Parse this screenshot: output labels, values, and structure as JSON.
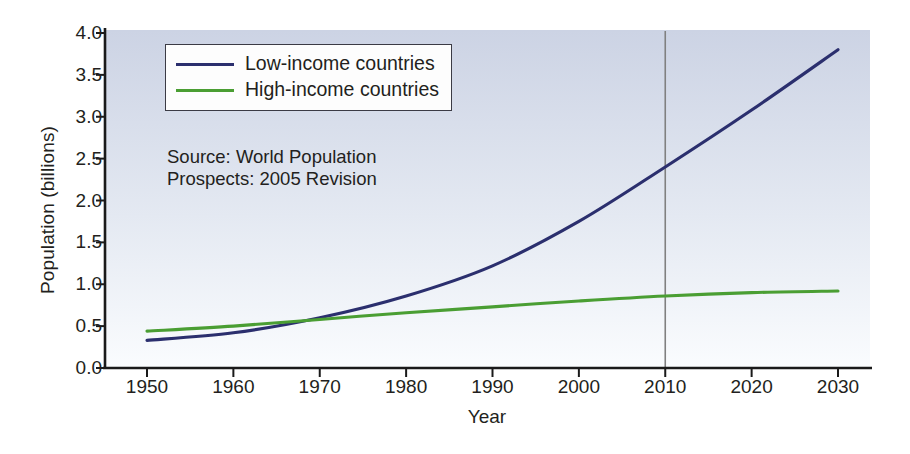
{
  "chart_data": {
    "type": "line",
    "title": "",
    "xlabel": "Year",
    "ylabel": "Population (billions)",
    "xlim": [
      1945,
      2034
    ],
    "ylim": [
      0.0,
      4.0
    ],
    "grid": false,
    "legend_position": "top-center",
    "x_ticks": [
      "1950",
      "1960",
      "1970",
      "1980",
      "1990",
      "2000",
      "2010",
      "2020",
      "2030"
    ],
    "y_ticks": [
      "0.0",
      "0.5",
      "1.0",
      "1.5",
      "2.0",
      "2.5",
      "3.0",
      "3.5",
      "4.0"
    ],
    "x": [
      1950,
      1960,
      1970,
      1980,
      1990,
      2000,
      2010,
      2020,
      2030
    ],
    "series": [
      {
        "name": "Low-income countries",
        "color": "#2b2f6e",
        "values": [
          0.33,
          0.42,
          0.6,
          0.86,
          1.22,
          1.75,
          2.4,
          3.08,
          3.8
        ]
      },
      {
        "name": "High-income countries",
        "color": "#4a9e33",
        "values": [
          0.44,
          0.5,
          0.58,
          0.66,
          0.73,
          0.8,
          0.86,
          0.9,
          0.92
        ]
      }
    ],
    "annotations": [
      {
        "name": "source-note",
        "text": "Source: World Population\nProspects: 2005 Revision"
      },
      {
        "name": "reference-line-2010",
        "x": 2010,
        "color": "#808080"
      }
    ],
    "plot_background_top": "#ccd3e4",
    "plot_background_bottom": "#fafcfe"
  },
  "axes": {
    "y_title": "Population (billions)",
    "x_title": "Year"
  },
  "legend": {
    "entries": [
      {
        "label": "Low-income countries"
      },
      {
        "label": "High-income countries"
      }
    ]
  },
  "source": {
    "text": "Source: World Population\nProspects: 2005 Revision"
  }
}
